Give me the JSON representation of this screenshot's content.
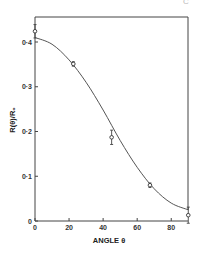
{
  "chart_data": {
    "type": "line",
    "title": "",
    "xlabel": "ANGLE θ",
    "ylabel": "R(θ)/R₀",
    "xlim": [
      0,
      90
    ],
    "ylim": [
      0,
      0.45
    ],
    "x_ticks": [
      0,
      20,
      40,
      60,
      80
    ],
    "x_tick_labels": [
      "0",
      "20",
      "40",
      "60",
      "80"
    ],
    "y_ticks": [
      0,
      0.1,
      0.2,
      0.3,
      0.4
    ],
    "y_tick_labels": [
      "0",
      "0·1",
      "0·2",
      "0·3",
      "0·4"
    ],
    "grid": false,
    "legend": null,
    "series": [
      {
        "name": "measured",
        "style": "open circles with error bars",
        "x": [
          0,
          22.5,
          45,
          67.5,
          90
        ],
        "y": [
          0.424,
          0.351,
          0.187,
          0.08,
          0.013
        ],
        "error": [
          0.015,
          0.005,
          0.016,
          0.005,
          0.018
        ]
      },
      {
        "name": "theory curve",
        "style": "solid line",
        "x": [
          0,
          10,
          20,
          30,
          40,
          50,
          60,
          70,
          80,
          90
        ],
        "y": [
          0.41,
          0.395,
          0.36,
          0.31,
          0.248,
          0.18,
          0.12,
          0.072,
          0.04,
          0.025
        ]
      }
    ]
  },
  "corner_glyph": "C"
}
